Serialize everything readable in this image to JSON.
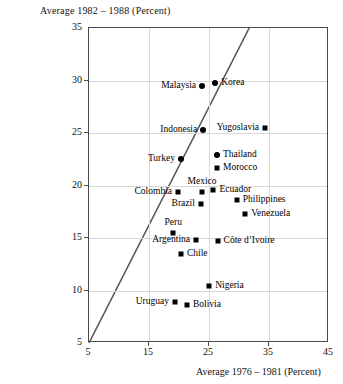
{
  "chart_data": {
    "type": "scatter",
    "title": "Average 1982 – 1988 (Percent)",
    "xlabel": "Average 1976 – 1981 (Percent)",
    "ylabel": "Average 1982 – 1988 (Percent)",
    "xlim": [
      5,
      45
    ],
    "ylim": [
      5,
      35
    ],
    "xticks": [
      "5",
      "15",
      "25",
      "35",
      "45"
    ],
    "yticks": [
      "5",
      "10",
      "15",
      "20",
      "25",
      "30",
      "35"
    ],
    "grid": true,
    "legend": "none",
    "annotations": [
      {
        "text": "45-degree reference line",
        "from": [
          5,
          5
        ],
        "to": [
          31.7,
          35
        ]
      }
    ],
    "points": [
      {
        "label": "Malaysia",
        "x": 24.0,
        "y": 29.4,
        "marker": "circle",
        "label_side": "left"
      },
      {
        "label": "Korea",
        "x": 26.2,
        "y": 29.7,
        "marker": "circle",
        "label_side": "right"
      },
      {
        "label": "Yugoslavia",
        "x": 34.5,
        "y": 25.4,
        "marker": "right-label",
        "label_side": "left"
      },
      {
        "label": "Indonesia",
        "x": 24.2,
        "y": 25.2,
        "marker": "circle",
        "label_side": "left"
      },
      {
        "label": "Thailand",
        "x": 26.5,
        "y": 22.8,
        "marker": "circle",
        "label_side": "right"
      },
      {
        "label": "Turkey",
        "x": 20.5,
        "y": 22.4,
        "marker": "circle",
        "label_side": "left"
      },
      {
        "label": "Morocco",
        "x": 26.5,
        "y": 21.6,
        "marker": "square",
        "label_side": "right"
      },
      {
        "label": "Mexico",
        "x": 24.0,
        "y": 19.3,
        "marker": "square",
        "label_side": "top"
      },
      {
        "label": "Ecuador",
        "x": 25.9,
        "y": 19.5,
        "marker": "square",
        "label_side": "right"
      },
      {
        "label": "Colombia",
        "x": 20.0,
        "y": 19.3,
        "marker": "square",
        "label_side": "left"
      },
      {
        "label": "Philippines",
        "x": 29.8,
        "y": 18.5,
        "marker": "square",
        "label_side": "right"
      },
      {
        "label": "Brazil",
        "x": 23.8,
        "y": 18.1,
        "marker": "square",
        "label_side": "left"
      },
      {
        "label": "Venezuela",
        "x": 31.2,
        "y": 17.2,
        "marker": "square",
        "label_side": "right"
      },
      {
        "label": "Peru",
        "x": 19.2,
        "y": 15.4,
        "marker": "square",
        "label_side": "top"
      },
      {
        "label": "Argentina",
        "x": 23.0,
        "y": 14.7,
        "marker": "square",
        "label_side": "left"
      },
      {
        "label": "Côte d’Ivoire",
        "x": 26.6,
        "y": 14.6,
        "marker": "square",
        "label_side": "right"
      },
      {
        "label": "Chile",
        "x": 20.5,
        "y": 13.4,
        "marker": "square",
        "label_side": "right"
      },
      {
        "label": "Nigeria",
        "x": 25.2,
        "y": 10.3,
        "marker": "square",
        "label_side": "right"
      },
      {
        "label": "Uruguay",
        "x": 19.5,
        "y": 8.8,
        "marker": "square",
        "label_side": "left"
      },
      {
        "label": "Bolivia",
        "x": 21.5,
        "y": 8.5,
        "marker": "square",
        "label_side": "right"
      }
    ]
  }
}
